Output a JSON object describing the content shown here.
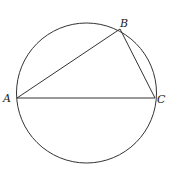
{
  "diagram": {
    "type": "geometry",
    "circle": {
      "cx": 86.5,
      "cy": 93,
      "r": 70
    },
    "points": {
      "A": {
        "label": "A",
        "x": 17,
        "y": 98
      },
      "B": {
        "label": "B",
        "x": 120,
        "y": 29
      },
      "C": {
        "label": "C",
        "x": 155,
        "y": 98
      }
    },
    "segments": [
      [
        "A",
        "B"
      ],
      [
        "B",
        "C"
      ],
      [
        "A",
        "C"
      ]
    ],
    "stroke_color": "#333333"
  }
}
